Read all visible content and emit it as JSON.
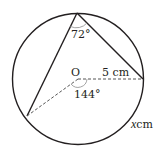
{
  "diagram": {
    "type": "circle-geometry",
    "center_label": "O",
    "angle_inscribed": "72°",
    "angle_center": "144°",
    "radius_label": "5 cm",
    "arc_label_var": "x",
    "arc_label_unit": "cm",
    "colors": {
      "stroke": "#231f20",
      "arc_marker": "#9a9a9a",
      "background": "#ffffff"
    }
  }
}
